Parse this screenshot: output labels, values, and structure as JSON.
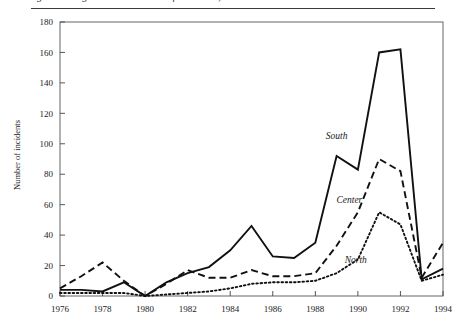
{
  "figure": {
    "caption_fragment": "igure 3.  Regional distribution of incidents, 1976–1994",
    "has_top_rule": true
  },
  "chart_data": {
    "type": "line",
    "title": "",
    "xlabel": "",
    "ylabel": "Number of incidents",
    "x": [
      1976,
      1977,
      1978,
      1979,
      1980,
      1981,
      1982,
      1983,
      1984,
      1985,
      1986,
      1987,
      1988,
      1989,
      1990,
      1991,
      1992,
      1993,
      1994
    ],
    "xlim": [
      1976,
      1994
    ],
    "ylim": [
      0,
      180
    ],
    "yticks": [
      0,
      20,
      40,
      60,
      80,
      100,
      120,
      140,
      160,
      180
    ],
    "xticks": [
      1976,
      1978,
      1980,
      1982,
      1984,
      1986,
      1988,
      1990,
      1992,
      1994
    ],
    "grid": false,
    "legend_position": "inline-annotations",
    "series": [
      {
        "name": "South",
        "style": "solid",
        "label_x": 1989.0,
        "label_y": 103,
        "values": [
          4,
          4,
          3,
          9,
          0,
          9,
          15,
          19,
          30,
          46,
          26,
          25,
          35,
          92,
          83,
          160,
          162,
          11,
          18
        ]
      },
      {
        "name": "Center",
        "style": "dashed",
        "label_x": 1989.6,
        "label_y": 61,
        "values": [
          5,
          13,
          22,
          10,
          0,
          8,
          17,
          12,
          12,
          17,
          13,
          13,
          15,
          33,
          55,
          90,
          82,
          12,
          35
        ]
      },
      {
        "name": "North",
        "style": "dotted",
        "label_x": 1989.9,
        "label_y": 22,
        "values": [
          2,
          2,
          2,
          2,
          0,
          1,
          2,
          3,
          5,
          8,
          9,
          9,
          10,
          15,
          24,
          55,
          47,
          10,
          14
        ]
      }
    ]
  },
  "axis": {
    "ytick_labels": [
      "0",
      "20",
      "40",
      "60",
      "80",
      "100",
      "120",
      "140",
      "160",
      "180"
    ],
    "xtick_labels": [
      "1976",
      "1978",
      "1980",
      "1982",
      "1984",
      "1986",
      "1988",
      "1990",
      "1992",
      "1994"
    ]
  }
}
